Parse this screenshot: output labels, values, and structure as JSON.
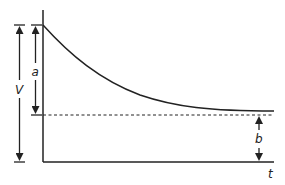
{
  "diagram": {
    "labels": {
      "V": "V",
      "a": "a",
      "b": "b",
      "t": "t"
    },
    "colors": {
      "line": "#222222",
      "background": "#ffffff"
    },
    "axes": {
      "x_label": "t",
      "y_label": ""
    },
    "curve": {
      "type": "exponential-decay",
      "start_level": "V",
      "asymptote_level": "b",
      "drop": "a"
    }
  }
}
